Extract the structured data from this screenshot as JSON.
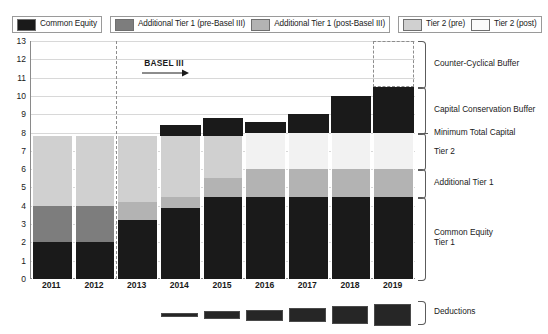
{
  "legend": {
    "groups": [
      {
        "items": [
          {
            "label": "Common Equity",
            "color": "#1a1a1a",
            "name": "common-equity"
          }
        ]
      },
      {
        "items": [
          {
            "label": "Additional Tier 1 (pre-Basel III)",
            "color": "#7d7d7d",
            "name": "additional-tier-1-pre"
          },
          {
            "label": "Additional Tier 1 (post-Basel III)",
            "color": "#b3b3b3",
            "name": "additional-tier-1-post"
          }
        ]
      },
      {
        "items": [
          {
            "label": "Tier 2 (pre)",
            "color": "#d0d0d0",
            "name": "tier-2-pre"
          },
          {
            "label": "Tier 2 (post)",
            "color": "#f2f2f2",
            "name": "tier-2-post"
          }
        ]
      }
    ]
  },
  "annotation": {
    "basel_label": "BASEL III"
  },
  "right_labels": [
    {
      "text": "Counter-Cyclical Buffer",
      "name": "counter-cyclical-buffer-label"
    },
    {
      "text": "Capital Conservation Buffer",
      "name": "capital-conservation-buffer-label"
    },
    {
      "text": "Minimum Total Capital",
      "name": "minimum-total-capital-label"
    },
    {
      "text": "Tier 2",
      "name": "tier-2-label"
    },
    {
      "text": "Additional Tier 1",
      "name": "additional-tier-1-label"
    },
    {
      "text": "Common Equity\nTier 1",
      "name": "common-equity-tier-1-label"
    },
    {
      "text": "Deductions",
      "name": "deductions-label"
    }
  ],
  "chart_data": {
    "type": "bar",
    "title": "",
    "subtitle": "",
    "xlabel": "",
    "ylabel": "",
    "stacked": true,
    "grid": true,
    "legend_position": "top",
    "ylim": [
      0,
      13
    ],
    "yticks": [
      0,
      1,
      2,
      3,
      4,
      5,
      6,
      7,
      8,
      9,
      10,
      11,
      12,
      13
    ],
    "categories": [
      "2011",
      "2012",
      "2013",
      "2014",
      "2015",
      "2016",
      "2017",
      "2018",
      "2019"
    ],
    "series": [
      {
        "name": "Common Equity",
        "color": "#1a1a1a",
        "values": [
          2.0,
          2.0,
          3.2,
          3.9,
          4.5,
          4.5,
          4.5,
          4.5,
          4.5
        ]
      },
      {
        "name": "Additional Tier 1 (pre-Basel III)",
        "color": "#7d7d7d",
        "values": [
          2.0,
          2.0,
          0,
          0,
          0,
          0,
          0,
          0,
          0
        ]
      },
      {
        "name": "Additional Tier 1 (post-Basel III)",
        "color": "#b3b3b3",
        "values": [
          0,
          0,
          1.0,
          0.6,
          1.0,
          1.5,
          1.5,
          1.5,
          1.5
        ]
      },
      {
        "name": "Tier 2 (pre)",
        "color": "#d0d0d0",
        "values": [
          3.8,
          3.8,
          3.6,
          3.3,
          2.3,
          0,
          0,
          0,
          0
        ]
      },
      {
        "name": "Tier 2 (post)",
        "color": "#f2f2f2",
        "values": [
          0,
          0,
          0,
          0,
          0,
          2.0,
          2.0,
          2.0,
          2.0
        ]
      },
      {
        "name": "Capital Conservation Buffer",
        "color": "#1a1a1a",
        "values": [
          0,
          0,
          0,
          0.6,
          1.0,
          0.6,
          1.0,
          2.0,
          2.5
        ]
      }
    ],
    "totals": [
      7.8,
      7.8,
      7.8,
      7.8,
      8.8,
      8.6,
      9.0,
      10.0,
      10.5
    ],
    "counter_cyclical_buffer": {
      "year": "2019",
      "from": 10.5,
      "to": 13.0,
      "style": "dashed"
    },
    "minimum_total_capital_line": 8.0,
    "basel_iii_start": "2013",
    "deductions": {
      "label": "Deductions",
      "years": [
        "2014",
        "2015",
        "2016",
        "2017",
        "2018",
        "2019"
      ],
      "relative_size": [
        0.2,
        0.4,
        0.5,
        0.6,
        0.85,
        1.0
      ]
    }
  }
}
